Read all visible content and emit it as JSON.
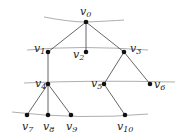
{
  "diagram": {
    "type": "tree",
    "colors": {
      "edge": "#555555",
      "node": "#111111",
      "level_line": "#777777",
      "label": "#222222"
    },
    "nodes": [
      {
        "id": "v0",
        "base": "v",
        "sub": "0",
        "x": 86,
        "y": 22,
        "lx": 80,
        "ly": 15
      },
      {
        "id": "v1",
        "base": "v",
        "sub": "1",
        "x": 48,
        "y": 52,
        "lx": 34,
        "ly": 52
      },
      {
        "id": "v2",
        "base": "v",
        "sub": "2",
        "x": 86,
        "y": 52,
        "lx": 73,
        "ly": 58
      },
      {
        "id": "v3",
        "base": "v",
        "sub": "3",
        "x": 124,
        "y": 52,
        "lx": 130,
        "ly": 52
      },
      {
        "id": "v4",
        "base": "v",
        "sub": "4",
        "x": 48,
        "y": 84,
        "lx": 35,
        "ly": 87
      },
      {
        "id": "v5",
        "base": "v",
        "sub": "5",
        "x": 104,
        "y": 84,
        "lx": 91,
        "ly": 87
      },
      {
        "id": "v6",
        "base": "v",
        "sub": "6",
        "x": 150,
        "y": 84,
        "lx": 154,
        "ly": 88
      },
      {
        "id": "v7",
        "base": "v",
        "sub": "7",
        "x": 27,
        "y": 115,
        "lx": 22,
        "ly": 130
      },
      {
        "id": "v8",
        "base": "v",
        "sub": "8",
        "x": 48,
        "y": 115,
        "lx": 43,
        "ly": 130
      },
      {
        "id": "v9",
        "base": "v",
        "sub": "9",
        "x": 71,
        "y": 115,
        "lx": 66,
        "ly": 130
      },
      {
        "id": "v10",
        "base": "v",
        "sub": "10",
        "x": 125,
        "y": 115,
        "lx": 117,
        "ly": 130
      }
    ],
    "edges": [
      [
        "v0",
        "v1"
      ],
      [
        "v0",
        "v2"
      ],
      [
        "v0",
        "v3"
      ],
      [
        "v1",
        "v4"
      ],
      [
        "v3",
        "v5"
      ],
      [
        "v3",
        "v6"
      ],
      [
        "v4",
        "v7"
      ],
      [
        "v4",
        "v8"
      ],
      [
        "v4",
        "v9"
      ],
      [
        "v5",
        "v10"
      ]
    ],
    "level_lines": [
      "M44 17 Q70 22 86 22 Q110 21 124 20",
      "M27 50 Q80 45 148 50",
      "M24 83 Q90 80 175 82",
      "M12 112 Q80 120 148 114"
    ]
  }
}
